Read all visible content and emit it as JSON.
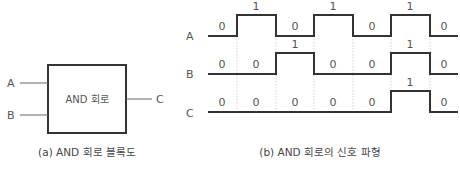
{
  "block_diagram": {
    "box_label": "AND 회로",
    "inputs": [
      "A",
      "B"
    ],
    "output": "C",
    "caption": "(a) AND 회로 블록도"
  },
  "waveform": {
    "caption": "(b) AND 회로의 신호 파형",
    "signals": [
      {
        "name": "A",
        "bits": [
          "0",
          "1",
          "0",
          "1",
          "0",
          "1",
          "0"
        ]
      },
      {
        "name": "B",
        "bits": [
          "0",
          "0",
          "1",
          "0",
          "0",
          "1",
          "0"
        ]
      },
      {
        "name": "C",
        "bits": [
          "0",
          "0",
          "0",
          "0",
          "0",
          "1",
          "0"
        ]
      }
    ],
    "colors": {
      "line": "#333333",
      "grid": "#bbbbbb",
      "text": "#555555"
    }
  }
}
